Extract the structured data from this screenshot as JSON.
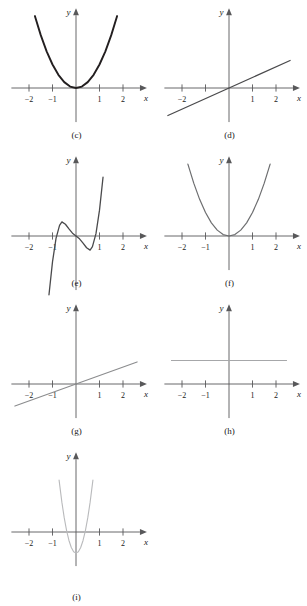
{
  "figure": {
    "type": "multi-panel-graph-grid",
    "columns": 2,
    "rows": 5,
    "panel_count": 9,
    "axis_labels": {
      "x": "x",
      "y": "y"
    },
    "tick_labels": [
      "-2",
      "-1",
      "1",
      "2"
    ],
    "background": "#ffffff",
    "axis_color": "#58585a",
    "text_color": "#1a1a1a"
  },
  "chart_data": [
    {
      "id": "c",
      "caption": "(c)",
      "type": "line",
      "title": "",
      "xlabel": "x",
      "ylabel": "y",
      "xlim": [
        -2.6,
        2.6
      ],
      "ylim": [
        -1.3,
        3.2
      ],
      "xticks": [
        -2,
        -1,
        1,
        2
      ],
      "yticks": [],
      "grid": false,
      "legend": "none",
      "curve_color": "#231f20",
      "curve_width": 1.9,
      "function": "y = x^2",
      "x": [
        -1.75,
        -1.5,
        -1.25,
        -1.0,
        -0.75,
        -0.5,
        -0.25,
        0,
        0.25,
        0.5,
        0.75,
        1.0,
        1.25,
        1.5,
        1.75
      ],
      "values": [
        3.06,
        2.25,
        1.56,
        1.0,
        0.56,
        0.25,
        0.06,
        0,
        0.06,
        0.25,
        0.56,
        1.0,
        1.56,
        2.25,
        3.06
      ]
    },
    {
      "id": "d",
      "caption": "(d)",
      "type": "line",
      "title": "",
      "xlabel": "x",
      "ylabel": "y",
      "xlim": [
        -2.6,
        2.6
      ],
      "ylim": [
        -1.3,
        3.2
      ],
      "xticks": [
        -2,
        -1,
        1,
        2
      ],
      "yticks": [],
      "grid": false,
      "legend": "none",
      "curve_color": "#4a4a4c",
      "curve_width": 1.3,
      "function": "y = 0.45x",
      "x": [
        -2.6,
        2.6
      ],
      "values": [
        -1.17,
        1.17
      ]
    },
    {
      "id": "e",
      "caption": "(e)",
      "type": "line",
      "title": "",
      "xlabel": "x",
      "ylabel": "y",
      "xlim": [
        -2.6,
        2.6
      ],
      "ylim": [
        -2.6,
        3.2
      ],
      "xticks": [
        -2,
        -1,
        1,
        2
      ],
      "yticks": [],
      "grid": false,
      "legend": "none",
      "curve_color": "#4a4a4c",
      "curve_width": 1.3,
      "function": "y = 5x(x^2-0.8)... odd quintic with local max near x=-0.6 and local min near x=0.5",
      "x": [
        -1.15,
        -1.0,
        -0.85,
        -0.7,
        -0.6,
        -0.45,
        -0.3,
        -0.15,
        0,
        0.15,
        0.3,
        0.45,
        0.6,
        0.7,
        0.85,
        1.0,
        1.15
      ],
      "values": [
        -2.5,
        -1.1,
        -0.1,
        0.45,
        0.6,
        0.5,
        0.3,
        0.12,
        0,
        -0.12,
        -0.3,
        -0.5,
        -0.6,
        -0.45,
        0.1,
        1.1,
        2.5
      ]
    },
    {
      "id": "f",
      "caption": "(f)",
      "type": "line",
      "title": "",
      "xlabel": "x",
      "ylabel": "y",
      "xlim": [
        -2.6,
        2.6
      ],
      "ylim": [
        -1.3,
        3.2
      ],
      "xticks": [
        -2,
        -1,
        1,
        2
      ],
      "yticks": [],
      "grid": false,
      "legend": "none",
      "curve_color": "#6d6e70",
      "curve_width": 1.2,
      "function": "y = x^2",
      "x": [
        -1.75,
        -1.5,
        -1.25,
        -1.0,
        -0.75,
        -0.5,
        -0.25,
        0,
        0.25,
        0.5,
        0.75,
        1.0,
        1.25,
        1.5,
        1.75
      ],
      "values": [
        3.06,
        2.25,
        1.56,
        1.0,
        0.56,
        0.25,
        0.06,
        0,
        0.06,
        0.25,
        0.56,
        1.0,
        1.56,
        2.25,
        3.06
      ]
    },
    {
      "id": "g",
      "caption": "(g)",
      "type": "line",
      "title": "",
      "xlabel": "x",
      "ylabel": "y",
      "xlim": [
        -2.6,
        2.6
      ],
      "ylim": [
        -1.3,
        3.2
      ],
      "xticks": [
        -2,
        -1,
        1,
        2
      ],
      "yticks": [],
      "grid": false,
      "legend": "none",
      "curve_color": "#8b8c8e",
      "curve_width": 1.1,
      "function": "y = 0.36x",
      "x": [
        -2.6,
        2.6
      ],
      "values": [
        -0.94,
        0.94
      ]
    },
    {
      "id": "h",
      "caption": "(h)",
      "type": "line",
      "title": "",
      "xlabel": "x",
      "ylabel": "y",
      "xlim": [
        -2.6,
        2.6
      ],
      "ylim": [
        -1.3,
        3.2
      ],
      "xticks": [
        -2,
        -1,
        1,
        2
      ],
      "yticks": [],
      "grid": false,
      "legend": "none",
      "curve_color": "#a6a7a9",
      "curve_width": 1.0,
      "function": "y = 1 (constant)",
      "x": [
        -2.45,
        2.45
      ],
      "values": [
        1.0,
        1.0
      ]
    },
    {
      "id": "i",
      "caption": "(i)",
      "type": "line",
      "title": "",
      "xlabel": "x",
      "ylabel": "y",
      "xlim": [
        -2.6,
        2.6
      ],
      "ylim": [
        -1.3,
        3.2
      ],
      "xticks": [
        -2,
        -1,
        1,
        2
      ],
      "yticks": [],
      "grid": false,
      "legend": "none",
      "curve_color": "#b9babc",
      "curve_width": 1.1,
      "function": "y = 6x^2 - 0.9 (narrow parabola, vertex below x-axis)",
      "x": [
        -0.72,
        -0.6,
        -0.5,
        -0.4,
        -0.3,
        -0.2,
        -0.1,
        0,
        0.1,
        0.2,
        0.3,
        0.4,
        0.5,
        0.6,
        0.72
      ],
      "values": [
        2.21,
        1.26,
        0.6,
        0.06,
        -0.36,
        -0.66,
        -0.84,
        -0.9,
        -0.84,
        -0.66,
        -0.36,
        0.06,
        0.6,
        1.26,
        2.21
      ]
    }
  ]
}
